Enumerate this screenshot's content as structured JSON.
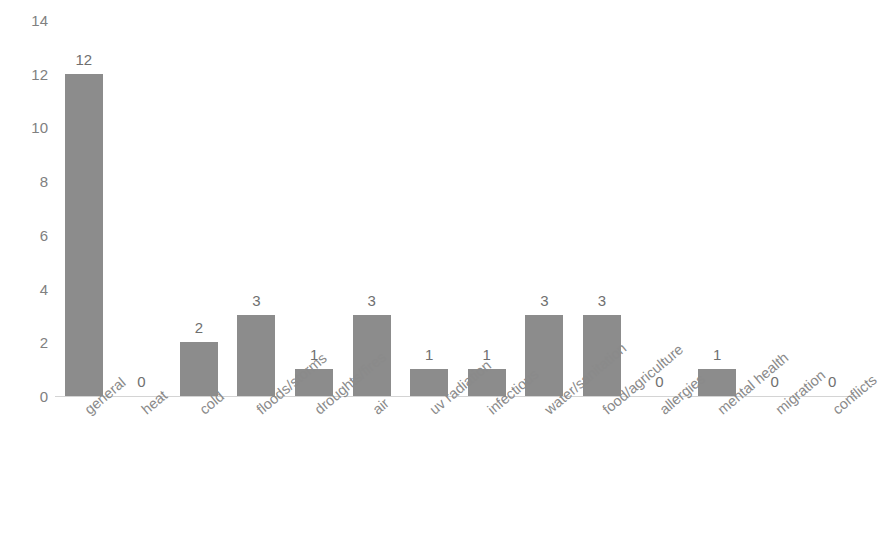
{
  "header": {
    "clipped_text": ""
  },
  "chart_data": {
    "type": "bar",
    "title": "",
    "subtitle": "",
    "xlabel": "",
    "ylabel": "",
    "categories": [
      "general",
      "heat",
      "cold",
      "floods/storms",
      "droughts/fires",
      "air",
      "uv radiation",
      "infectious",
      "water/sanitation",
      "food/agriculture",
      "allergies",
      "mental health",
      "migration",
      "conflicts"
    ],
    "values": [
      12,
      0,
      2,
      3,
      1,
      3,
      1,
      1,
      3,
      3,
      0,
      1,
      0,
      0
    ],
    "data_labels": [
      "12",
      "0",
      "2",
      "3",
      "1",
      "3",
      "1",
      "1",
      "3",
      "3",
      "0",
      "1",
      "0",
      "0"
    ],
    "ylim": [
      0,
      14
    ],
    "yticks": [
      0,
      2,
      4,
      6,
      8,
      10,
      12,
      14
    ],
    "ytick_labels": [
      "0",
      "2",
      "4",
      "6",
      "8",
      "10",
      "12",
      "14"
    ],
    "grid": false,
    "legend": null,
    "legend_position": "none",
    "bar_color": "#8c8c8c",
    "axis_color": "#d4d4d4",
    "text_color": "#808080",
    "background": "#ffffff"
  }
}
